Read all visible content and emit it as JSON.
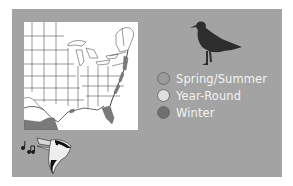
{
  "figure": {
    "map": {
      "region": "Eastern United States",
      "range_fill_color": "#7a7a7a",
      "background_color": "#ffffff"
    },
    "icons": {
      "bird_silhouette": "gull-silhouette-icon",
      "song_bird_head": "songbird-head-icon",
      "music_notes": "music-notes-icon"
    },
    "legend": {
      "items": [
        {
          "label": "Spring/Summer",
          "color": "#9a9a9a"
        },
        {
          "label": "Year-Round",
          "color": "#dedede"
        },
        {
          "label": "Winter",
          "color": "#6f6f6f"
        }
      ]
    },
    "colors": {
      "panel": "#a3a3a3",
      "page": "#ffffff",
      "legend_text": "#f2f2f2"
    }
  }
}
